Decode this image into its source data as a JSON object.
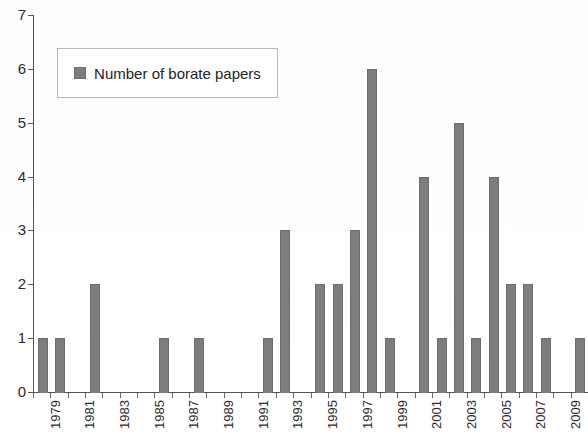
{
  "legend": {
    "swatch_color": "#7d7d7d",
    "entries": [
      {
        "label": "Number of borate papers"
      }
    ]
  },
  "axis": {
    "y_ticks": [
      "0",
      "1",
      "2",
      "3",
      "4",
      "5",
      "6",
      "7"
    ],
    "x_ticks": [
      "1979",
      "1981",
      "1983",
      "1985",
      "1987",
      "1989",
      "1991",
      "1993",
      "1995",
      "1997",
      "1999",
      "2001",
      "2003",
      "2005",
      "2007",
      "2009"
    ]
  },
  "chart_data": {
    "type": "bar",
    "title": "",
    "subtitle": "",
    "xlabel": "",
    "ylabel": "",
    "ylim": [
      0,
      7
    ],
    "ytick_step": 1,
    "grid": false,
    "legend_position": "upper-left-inside",
    "bar_color": "#7d7d7d",
    "series": [
      {
        "name": "Number of borate papers",
        "values": [
          1,
          1,
          0,
          2,
          0,
          0,
          0,
          1,
          0,
          1,
          0,
          0,
          0,
          1,
          3,
          0,
          2,
          2,
          3,
          6,
          1,
          0,
          4,
          1,
          5,
          1,
          4,
          2,
          2,
          1,
          0,
          1
        ]
      }
    ],
    "categories": [
      "1979",
      "1980",
      "1981",
      "1982",
      "1983",
      "1984",
      "1985",
      "1986",
      "1987",
      "1988",
      "1989",
      "1990",
      "1991",
      "1992",
      "1993",
      "1994",
      "1995",
      "1996",
      "1997",
      "1998",
      "1999",
      "2000",
      "2001",
      "2002",
      "2003",
      "2004",
      "2005",
      "2006",
      "2007",
      "2008",
      "2009",
      "2010"
    ],
    "points": [
      {
        "year": "1979",
        "value": 1
      },
      {
        "year": "1980",
        "value": 1
      },
      {
        "year": "1981",
        "value": 0
      },
      {
        "year": "1982",
        "value": 2
      },
      {
        "year": "1983",
        "value": 0
      },
      {
        "year": "1984",
        "value": 0
      },
      {
        "year": "1985",
        "value": 0
      },
      {
        "year": "1986",
        "value": 1
      },
      {
        "year": "1987",
        "value": 0
      },
      {
        "year": "1988",
        "value": 1
      },
      {
        "year": "1989",
        "value": 0
      },
      {
        "year": "1990",
        "value": 0
      },
      {
        "year": "1991",
        "value": 0
      },
      {
        "year": "1992",
        "value": 1
      },
      {
        "year": "1993",
        "value": 3
      },
      {
        "year": "1994",
        "value": 0
      },
      {
        "year": "1995",
        "value": 2
      },
      {
        "year": "1996",
        "value": 2
      },
      {
        "year": "1997",
        "value": 3
      },
      {
        "year": "1998",
        "value": 6
      },
      {
        "year": "1999",
        "value": 1
      },
      {
        "year": "2000",
        "value": 0
      },
      {
        "year": "2001",
        "value": 4
      },
      {
        "year": "2002",
        "value": 1
      },
      {
        "year": "2003",
        "value": 5
      },
      {
        "year": "2004",
        "value": 1
      },
      {
        "year": "2005",
        "value": 4
      },
      {
        "year": "2006",
        "value": 2
      },
      {
        "year": "2007",
        "value": 2
      },
      {
        "year": "2008",
        "value": 1
      },
      {
        "year": "2009",
        "value": 0
      },
      {
        "year": "2010",
        "value": 1
      }
    ]
  }
}
